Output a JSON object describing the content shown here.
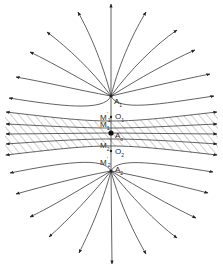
{
  "diagram": {
    "colors": {
      "line": "#3a3a3a",
      "hatch": "#7a7a7a",
      "background": "#ffffff"
    },
    "labels": {
      "A1": "A",
      "A1_sub": "1",
      "A2": "A",
      "A2_sub": "2",
      "Ao": "A",
      "Ao_sub": "o",
      "O1": "O",
      "O1_sub": "1",
      "O2": "O",
      "O2_sub": "2",
      "M1p": "M",
      "M1p_sub": "1",
      "M1p_sup": "'",
      "M1": "M",
      "M1_sub": "1",
      "M2": "M",
      "M2_sub": "2",
      "M2p": "M",
      "M2p_sub": "2",
      "M2p_sup": "'"
    },
    "points": {
      "A1": [
        111,
        96
      ],
      "A2": [
        111,
        171
      ],
      "Ao": [
        111,
        133
      ],
      "O1": [
        111,
        117
      ],
      "O2": [
        111,
        151
      ]
    },
    "upper_fan_tips": [
      [
        111,
        4
      ],
      [
        146,
        12
      ],
      [
        78,
        12
      ],
      [
        177,
        30
      ],
      [
        47,
        32
      ],
      [
        195,
        50
      ],
      [
        30,
        52
      ],
      [
        210,
        74
      ],
      [
        16,
        77
      ],
      [
        214,
        96
      ],
      [
        9,
        98
      ]
    ],
    "lower_fan_tips": [
      [
        112,
        264
      ],
      [
        146,
        254
      ],
      [
        79,
        253
      ],
      [
        177,
        238
      ],
      [
        49,
        237
      ],
      [
        196,
        218
      ],
      [
        30,
        217
      ],
      [
        208,
        193
      ],
      [
        16,
        194
      ],
      [
        213,
        172
      ],
      [
        10,
        173
      ]
    ],
    "band_lines_y": [
      114,
      126,
      135,
      144,
      153
    ]
  }
}
